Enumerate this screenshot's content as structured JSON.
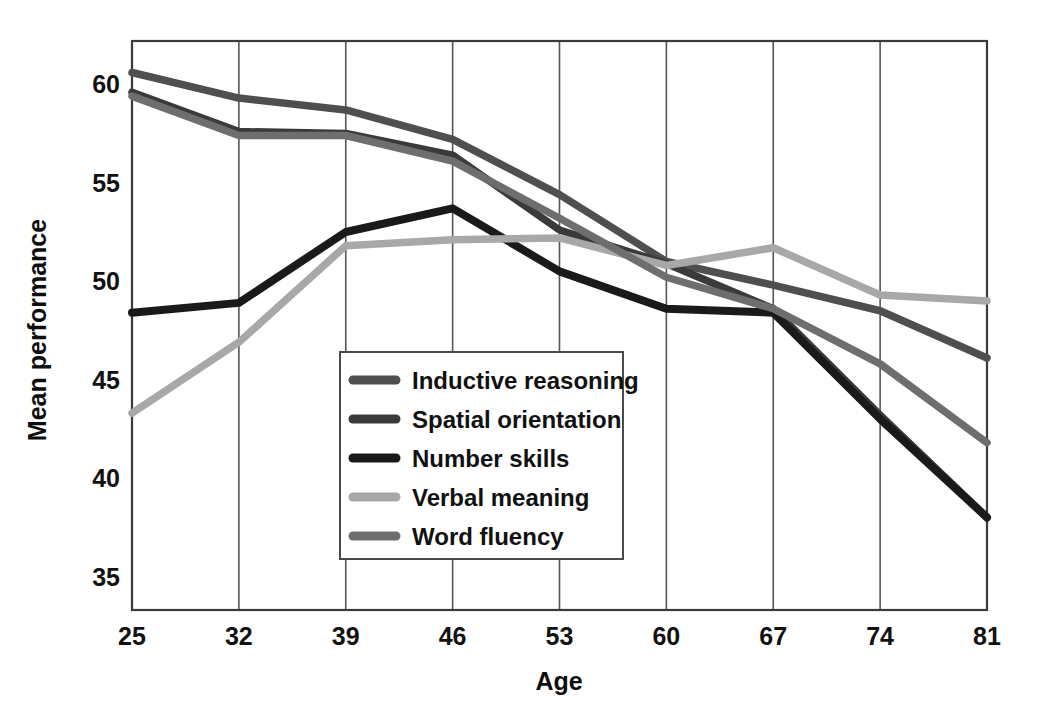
{
  "figure": {
    "background_color": "#ffffff",
    "frame_color": "#3a3a3a",
    "grid_color": "#555555"
  },
  "axes": {
    "x_title": "Age",
    "y_title": "Mean performance",
    "x_ticks": [
      "25",
      "32",
      "39",
      "46",
      "53",
      "60",
      "67",
      "74",
      "81"
    ],
    "y_ticks": [
      "35",
      "40",
      "45",
      "50",
      "55",
      "60"
    ]
  },
  "legend": {
    "items": [
      {
        "label": "Inductive reasoning",
        "color": "#4f4f4f"
      },
      {
        "label": "Spatial orientation",
        "color": "#3a3a3a"
      },
      {
        "label": "Number skills",
        "color": "#1a1a1a"
      },
      {
        "label": "Verbal meaning",
        "color": "#a8a8a8"
      },
      {
        "label": "Word fluency",
        "color": "#6e6e6e"
      }
    ]
  },
  "chart_data": {
    "type": "line",
    "title": "",
    "xlabel": "Age",
    "ylabel": "Mean performance",
    "x": [
      25,
      32,
      39,
      46,
      53,
      60,
      67,
      74,
      81
    ],
    "categories": [
      "25",
      "32",
      "39",
      "46",
      "53",
      "60",
      "67",
      "74",
      "81"
    ],
    "xlim": [
      25,
      81
    ],
    "ylim": [
      33.3,
      62.2
    ],
    "yticks": [
      35,
      40,
      45,
      50,
      55,
      60
    ],
    "grid": "vertical",
    "legend_position": "center-left-inside",
    "series": [
      {
        "name": "Inductive reasoning",
        "color": "#4f4f4f",
        "values": [
          60.6,
          59.3,
          58.7,
          57.2,
          54.4,
          51.0,
          49.8,
          48.5,
          46.1
        ]
      },
      {
        "name": "Spatial orientation",
        "color": "#3a3a3a",
        "values": [
          59.6,
          57.6,
          57.5,
          56.4,
          52.6,
          50.9,
          48.6,
          43.2,
          38.0
        ]
      },
      {
        "name": "Number skills",
        "color": "#1a1a1a",
        "values": [
          48.4,
          48.9,
          52.5,
          53.7,
          50.5,
          48.6,
          48.4,
          43.0,
          38.0
        ]
      },
      {
        "name": "Verbal meaning",
        "color": "#a8a8a8",
        "values": [
          43.3,
          46.9,
          51.8,
          52.1,
          52.2,
          50.8,
          51.7,
          49.3,
          49.0
        ]
      },
      {
        "name": "Word fluency",
        "color": "#6e6e6e",
        "values": [
          59.4,
          57.4,
          57.4,
          56.1,
          53.2,
          50.2,
          48.6,
          45.8,
          41.8
        ]
      }
    ]
  }
}
